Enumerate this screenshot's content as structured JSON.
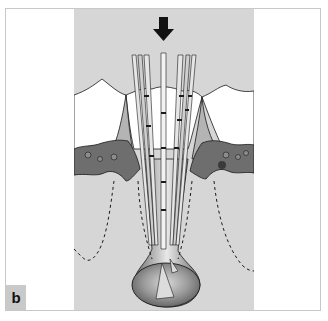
{
  "figure": {
    "panel_label": "b",
    "colors": {
      "background": "#ffffff",
      "panel": "#d6d6d6",
      "crown": "#ffffff",
      "bone": "#6e6e6e",
      "gum": "#b0b0b0",
      "lesion": "#8a8a8a",
      "outline": "#1a1a1a"
    },
    "arrow": "down-arrow",
    "files_count": 6
  }
}
